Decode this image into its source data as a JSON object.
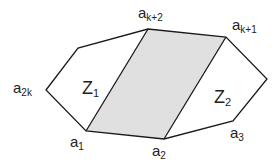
{
  "diagram": {
    "colors": {
      "stroke": "#1a1a1a",
      "shaded_fill": "#e0e0e0",
      "background": "#ffffff"
    },
    "polygon_points": "46,90 78,48 148,29 226,37 267,79 233,121 164,139 86,131",
    "parallelogram_points": "86,131 148,29 226,37 164,139",
    "vertices": {
      "a_2k": {
        "base": "a",
        "sub": "2k"
      },
      "a_k2": {
        "base": "a",
        "sub": "k+2"
      },
      "a_k1": {
        "base": "a",
        "sub": "k+1"
      },
      "a_1": {
        "base": "a",
        "sub": "1"
      },
      "a_2": {
        "base": "a",
        "sub": "2"
      },
      "a_3": {
        "base": "a",
        "sub": "3"
      }
    },
    "regions": {
      "z1": {
        "base": "Z",
        "sub": "1"
      },
      "z2": {
        "base": "Z",
        "sub": "2"
      }
    }
  }
}
